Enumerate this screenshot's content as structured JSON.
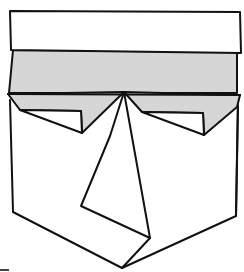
{
  "figure": {
    "colors": {
      "background": "#ffffff",
      "stroke": "#111111",
      "shade": "#d6d6d6"
    },
    "parts": [
      {
        "id": "top-band",
        "fill": "white"
      },
      {
        "id": "shaded-band",
        "fill": "gray"
      },
      {
        "id": "flap-left",
        "fill": "gray"
      },
      {
        "id": "flap-right",
        "fill": "gray"
      },
      {
        "id": "pocket-body",
        "fill": "white"
      },
      {
        "id": "center-pleat",
        "fill": "white"
      }
    ]
  }
}
